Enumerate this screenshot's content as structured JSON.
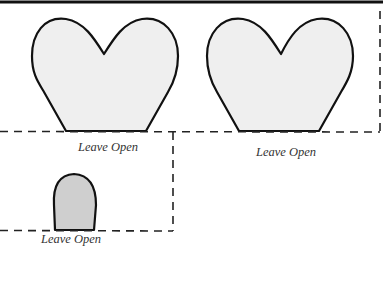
{
  "diagram": {
    "type": "papercraft-template",
    "colors": {
      "outline": "#111111",
      "heart_fill": "#efefef",
      "tab_fill": "#cfcfcf",
      "dash": "#222222",
      "label": "#333333"
    },
    "shapes": [
      {
        "name": "heart-left",
        "shape": "heart"
      },
      {
        "name": "heart-right",
        "shape": "heart"
      },
      {
        "name": "tab",
        "shape": "rounded-tab"
      }
    ],
    "labels": [
      {
        "name": "label-leave-open-1",
        "text": "Leave Open"
      },
      {
        "name": "label-leave-open-2",
        "text": "Leave Open"
      },
      {
        "name": "label-leave-open-3",
        "text": "Leave Open"
      }
    ]
  }
}
